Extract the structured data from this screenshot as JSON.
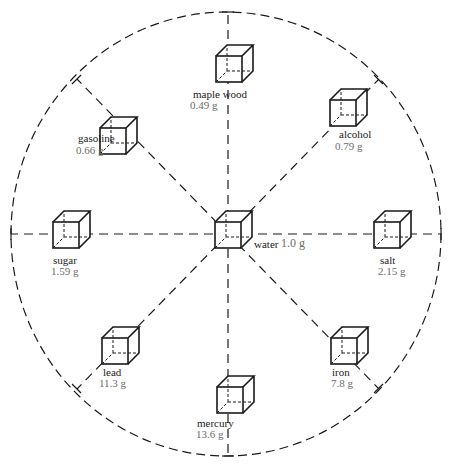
{
  "diagram": {
    "title": "",
    "center": {
      "name": "water",
      "value": "1.0 g"
    },
    "items": [
      {
        "name": "maple wood",
        "value": "0.49 g",
        "position": "top"
      },
      {
        "name": "alcohol",
        "value": "0.79 g",
        "position": "top-right"
      },
      {
        "name": "salt",
        "value": "2.15 g",
        "position": "right"
      },
      {
        "name": "iron",
        "value": "7.8 g",
        "position": "bottom-right"
      },
      {
        "name": "mercury",
        "value": "13.6 g",
        "position": "bottom"
      },
      {
        "name": "lead",
        "value": "11.3 g",
        "position": "bottom-left"
      },
      {
        "name": "sugar",
        "value": "1.59 g",
        "position": "left"
      },
      {
        "name": "gasoline",
        "value": "0.66 g",
        "position": "top-left"
      }
    ],
    "colors": {
      "line": "#1a1a1a",
      "label": "#1a1a1a",
      "value": "#6b6b6b",
      "background": "#ffffff"
    }
  }
}
